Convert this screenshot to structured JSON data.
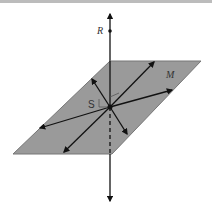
{
  "diagram": {
    "labels": {
      "line": "R",
      "plane": "M",
      "point": "S"
    },
    "colors": {
      "plane_fill": "#9a9a9a",
      "plane_stroke": "#777777",
      "line": "#111111",
      "top_bar": "#bcbcbc"
    }
  }
}
